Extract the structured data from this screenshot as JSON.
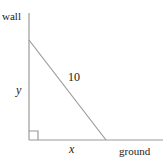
{
  "figure": {
    "kind": "right-triangle-geometry-diagram",
    "background_color": "#ffffff",
    "stroke_color": "#9a9a9a",
    "text_color": "#1a1a1a",
    "labels": {
      "wall": "wall",
      "ground": "ground",
      "hypotenuse": "10",
      "vertical_leg": "y",
      "horizontal_leg": "x"
    },
    "geometry": {
      "wall_line": {
        "x1": 29,
        "y1": 13,
        "x2": 29,
        "y2": 140
      },
      "ground_line": {
        "x1": 29,
        "y1": 140,
        "x2": 163,
        "y2": 140
      },
      "hypotenuse_line": {
        "x1": 29,
        "y1": 40,
        "x2": 106,
        "y2": 140
      },
      "right_angle_marker": {
        "x": 29,
        "y": 131,
        "size": 9
      }
    }
  }
}
